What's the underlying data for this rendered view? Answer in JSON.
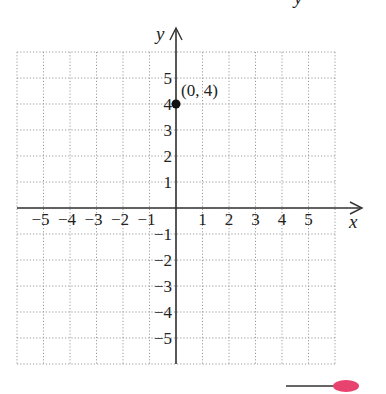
{
  "chart_data": {
    "type": "scatter",
    "title": "",
    "xlabel": "x",
    "ylabel": "y",
    "xlim": [
      -6,
      6
    ],
    "ylim": [
      -6,
      6
    ],
    "grid": true,
    "grid_style": "dotted",
    "x_ticks": [
      "-5",
      "-4",
      "-3",
      "-2",
      "-1",
      "1",
      "2",
      "3",
      "4",
      "5"
    ],
    "y_ticks": [
      "5",
      "4",
      "3",
      "2",
      "1",
      "-1",
      "-2",
      "-3",
      "-4",
      "-5"
    ],
    "points": [
      {
        "x": 0,
        "y": 4,
        "label": "(0, 4)"
      }
    ]
  },
  "colors": {
    "axis": "#333333",
    "grid": "#9a9a9a",
    "point": "#111111",
    "pen_tip": "#e8436e"
  },
  "top_fragment": "y"
}
